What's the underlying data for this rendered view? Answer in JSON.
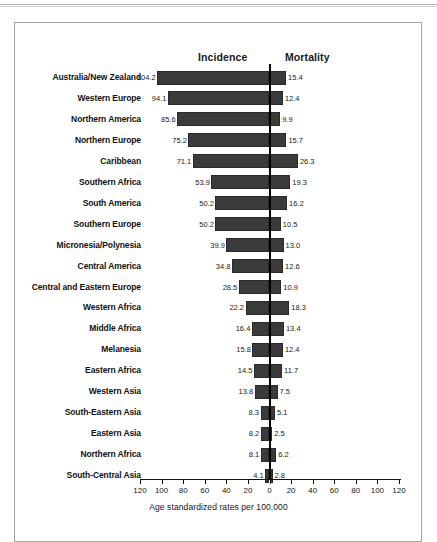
{
  "chart_data": {
    "type": "bar",
    "orientation": "horizontal-diverging",
    "title": "",
    "xlabel": "Age standardized rates per 100,000",
    "ylabel": "",
    "categories": [
      "Australia/New Zealand",
      "Western Europe",
      "Northern America",
      "Northern Europe",
      "Caribbean",
      "Southern Africa",
      "South America",
      "Southern Europe",
      "Micronesia/Polynesia",
      "Central America",
      "Central and Eastern Europe",
      "Western Africa",
      "Middle Africa",
      "Melanesia",
      "Eastern Africa",
      "Western Asia",
      "South-Eastern Asia",
      "Eastern Asia",
      "Northern Africa",
      "South-Central Asia"
    ],
    "series": [
      {
        "name": "Incidence",
        "direction": "left",
        "values": [
          104.2,
          94.1,
          85.6,
          75.2,
          71.1,
          53.9,
          50.2,
          50.2,
          39.9,
          34.8,
          28.5,
          22.2,
          16.4,
          15.8,
          14.5,
          13.8,
          8.3,
          8.2,
          8.1,
          4.1
        ]
      },
      {
        "name": "Mortality",
        "direction": "right",
        "values": [
          15.4,
          12.4,
          9.9,
          15.7,
          26.3,
          19.3,
          16.2,
          10.5,
          13.0,
          12.6,
          10.9,
          18.3,
          13.4,
          12.4,
          11.7,
          7.5,
          5.1,
          2.5,
          6.2,
          2.8
        ]
      }
    ],
    "xticks_left": [
      120,
      100,
      80,
      60,
      40,
      20
    ],
    "xtick_center": 0,
    "xticks_right": [
      20,
      40,
      60,
      80,
      100,
      120
    ],
    "xlim": [
      -120,
      120
    ],
    "grid": false,
    "legend": "column-headers",
    "bar_color": "#3b3b3b"
  },
  "headers": {
    "incidence": "Incidence",
    "mortality": "Mortality"
  },
  "axis": {
    "caption": "Age standardized rates per 100,000",
    "ticks": [
      "120",
      "100",
      "80",
      "60",
      "40",
      "20",
      "0",
      "20",
      "40",
      "60",
      "80",
      "100",
      "120"
    ]
  }
}
